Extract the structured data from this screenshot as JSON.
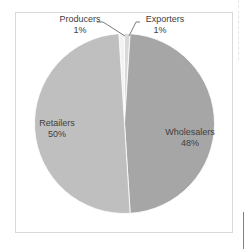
{
  "chart_data": {
    "type": "pie",
    "title": "",
    "categories": [
      "Producers",
      "Exporters",
      "Wholesalers",
      "Retailers"
    ],
    "values": [
      1,
      1,
      48,
      50
    ],
    "labels": [
      "1%",
      "1%",
      "48%",
      "50%"
    ],
    "colors": [
      "#f2f2f2",
      "#d9d9d9",
      "#a6a6a6",
      "#bfbfbf"
    ],
    "legend": "none",
    "data_labels": "category name and percentage"
  },
  "labels": {
    "producers": {
      "name": "Producers",
      "pct": "1%"
    },
    "exporters": {
      "name": "Exporters",
      "pct": "1%"
    },
    "wholesalers": {
      "name": "Wholesalers",
      "pct": "48%"
    },
    "retailers": {
      "name": "Retailers",
      "pct": "50%"
    }
  }
}
